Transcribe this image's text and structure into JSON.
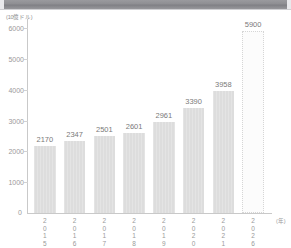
{
  "topbar": {
    "name": "window-title-bar"
  },
  "chart_data": {
    "type": "bar",
    "title": "",
    "subtitle": "",
    "xlabel": "(年)",
    "ylabel": "(10億ドル)",
    "unit_note": "(10億ドル)",
    "categories": [
      "2015",
      "2016",
      "2017",
      "2018",
      "2019",
      "2020",
      "2021",
      "2026"
    ],
    "values": [
      2170,
      2347,
      2501,
      2601,
      2961,
      3390,
      3958,
      5900
    ],
    "value_labels": [
      "2170",
      "2347",
      "2501",
      "2601",
      "2961",
      "3390",
      "3958",
      "5900"
    ],
    "forecast_flags": [
      false,
      false,
      false,
      false,
      false,
      false,
      false,
      true
    ],
    "ylim": [
      0,
      6000
    ],
    "yticks": [
      0,
      1000,
      2000,
      3000,
      4000,
      5000,
      6000
    ],
    "ytick_labels": [
      "0",
      "1000",
      "2000",
      "3000",
      "4000",
      "5000",
      "6000"
    ],
    "grid": false,
    "legend": "none",
    "colors": {
      "bar": "#e0e0e0",
      "forecast_bar": "#fcfcfc",
      "axis": "#c9c9c9",
      "text": "#9a9a9a",
      "value_text": "#7a7a7a",
      "topbar": "#8e8e92"
    }
  }
}
